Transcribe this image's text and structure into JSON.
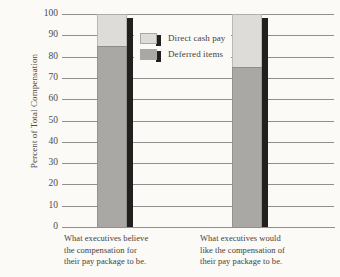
{
  "chart_data": {
    "type": "bar",
    "subtype": "stacked-column",
    "title": "",
    "xlabel": "",
    "ylabel": "Percent of Total Compensation",
    "ylim": [
      0,
      100
    ],
    "yticks": [
      0,
      10,
      20,
      30,
      40,
      50,
      60,
      70,
      80,
      90,
      100
    ],
    "ytick_labels": [
      "0",
      "10",
      "20",
      "30",
      "40",
      "50",
      "60",
      "70",
      "80",
      "90",
      "100"
    ],
    "grid": true,
    "grid_axis": "y",
    "legend_position": "upper-center",
    "categories": [
      "What executives believe the compensation for their pay package to be.",
      "What executives would like the compensation of their pay package to be."
    ],
    "category_lines": [
      [
        "What executives believe",
        "the compensation for",
        "their pay package to be."
      ],
      [
        "What executives would",
        "like the compensation of",
        "their pay package to be."
      ]
    ],
    "series": [
      {
        "name": "Deferred items",
        "values": [
          85,
          75
        ],
        "color": "#a9a8a5"
      },
      {
        "name": "Direct cash pay",
        "values": [
          15,
          25
        ],
        "color": "#dddcd8"
      }
    ],
    "legend_entries": [
      {
        "label": "Direct cash pay",
        "color": "#dddcd8"
      },
      {
        "label": "Deferred items",
        "color": "#a9a8a5"
      }
    ]
  },
  "colors": {
    "background": "#fbfaf7",
    "gridline": "#8f8f8f",
    "shadow": "#241f1f",
    "text": "#3f3f3f",
    "direct_cash_pay": "#dddcd8",
    "deferred_items": "#a9a8a5"
  }
}
